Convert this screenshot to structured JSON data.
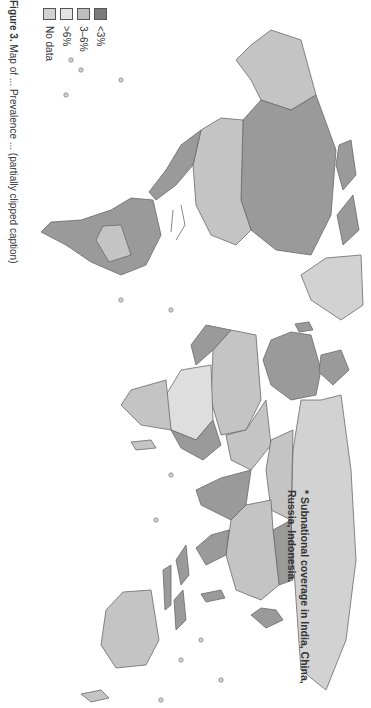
{
  "figure": {
    "note": "* Subnational coverage in India, China, Russia, Indonesia.",
    "caption_label": "Figure 3.",
    "caption_text": "Map of ... Prevalence ... (partially clipped caption)",
    "orientation": "rotated 90° clockwise"
  },
  "legend": {
    "items": [
      {
        "label": "<3%",
        "color": "#7a7a7a"
      },
      {
        "label": "3–6%",
        "color": "#bdbdbd"
      },
      {
        "label": ">6%",
        "color": "#e4e4e4"
      },
      {
        "label": "No data",
        "color": "#d2d2d2"
      }
    ]
  },
  "colors": {
    "low": "#9a9a9a",
    "mid": "#c4c4c4",
    "high": "#dedede",
    "nodata": "#d2d2d2",
    "outline": "#6a6a6a",
    "ocean": "#ffffff"
  },
  "regions": [
    {
      "name": "North America (Canada)",
      "category": "<3%"
    },
    {
      "name": "United States",
      "category": "3–6%"
    },
    {
      "name": "Greenland",
      "category": "No data"
    },
    {
      "name": "Alaska",
      "category": "3–6%"
    },
    {
      "name": "Mexico",
      "category": "<3%"
    },
    {
      "name": "South America",
      "category": "<3%"
    },
    {
      "name": "Europe",
      "category": "<3%"
    },
    {
      "name": "Africa",
      "category": "mixed"
    },
    {
      "name": "Russia",
      "category": "No data"
    },
    {
      "name": "China",
      "category": "3–6%"
    },
    {
      "name": "India",
      "category": "<3%"
    },
    {
      "name": "Indonesia",
      "category": "<3%"
    },
    {
      "name": "Australia",
      "category": "3–6%"
    }
  ]
}
